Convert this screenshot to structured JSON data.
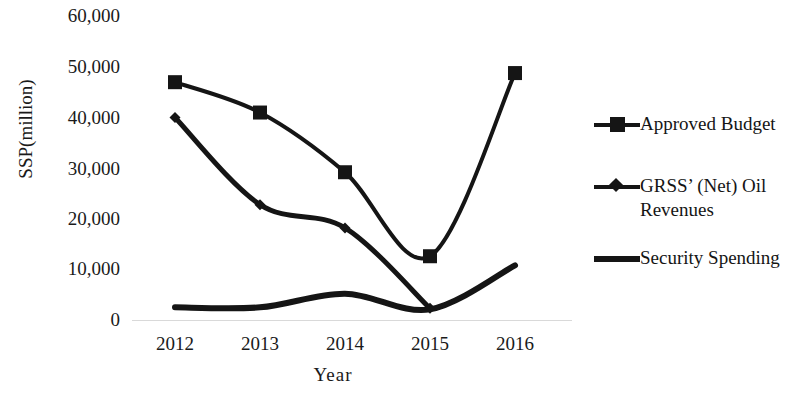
{
  "chart_data": {
    "type": "line",
    "title": "",
    "xlabel": "Year",
    "ylabel": "SSP(million)",
    "categories": [
      "2012",
      "2013",
      "2014",
      "2015",
      "2016"
    ],
    "x": [
      2012,
      2013,
      2014,
      2015,
      2016
    ],
    "ylim": [
      0,
      60000
    ],
    "ytick_labels": [
      "60,000",
      "50,000",
      "40,000",
      "30,000",
      "20,000",
      "10,000",
      "0"
    ],
    "ytick_values": [
      60000,
      50000,
      40000,
      30000,
      20000,
      10000,
      0
    ],
    "grid": false,
    "legend_position": "right",
    "series": [
      {
        "name": "Approved  Budget",
        "marker": "square",
        "values": [
          47000,
          41000,
          29200,
          12600,
          48800
        ]
      },
      {
        "name": "GRSS’ (Net) Oil Revenues",
        "marker": "diamond",
        "values": [
          40000,
          22800,
          18200,
          2300,
          null
        ]
      },
      {
        "name": "Security Spending",
        "marker": "none",
        "values": [
          2500,
          2500,
          5200,
          2100,
          10800
        ]
      }
    ],
    "colors": {
      "line": "#151515",
      "axis": "#d9d9d9",
      "text": "#1a1a1a"
    }
  },
  "legend": {
    "items": [
      {
        "label": "Approved  Budget",
        "marker": "square-marker"
      },
      {
        "label": "GRSS’ (Net) Oil",
        "label2": "Revenues",
        "marker": "diamond-marker"
      },
      {
        "label": "Security Spending",
        "marker": "line-marker"
      }
    ]
  }
}
